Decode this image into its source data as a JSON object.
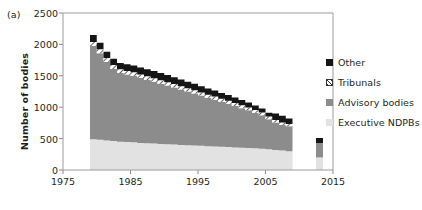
{
  "figure": {
    "panel_label": "(a)",
    "y_axis_title": "Number of bodies"
  },
  "chart_data": {
    "type": "area",
    "title": "",
    "subtitle": "",
    "xlabel": "",
    "ylabel": "Number of bodies",
    "xlim": [
      1975,
      2015
    ],
    "ylim": [
      0,
      2500
    ],
    "xticks": [
      1975,
      1985,
      1995,
      2005,
      2015
    ],
    "yticks": [
      0,
      500,
      1000,
      1500,
      2000,
      2500
    ],
    "grid": false,
    "legend_position": "right",
    "stacked": true,
    "stack_order_bottom_to_top": [
      "Executive NDPBs",
      "Advisory bodies",
      "Tribunals",
      "Other"
    ],
    "x": [
      1979,
      1980,
      1981,
      1982,
      1983,
      1984,
      1985,
      1986,
      1987,
      1988,
      1989,
      1990,
      1991,
      1992,
      1993,
      1994,
      1995,
      1996,
      1997,
      1998,
      1999,
      2000,
      2001,
      2002,
      2003,
      2004,
      2005,
      2006,
      2007,
      2008,
      2009,
      2013
    ],
    "series": [
      {
        "name": "Executive NDPBs",
        "color": "#e2e2e2",
        "pattern": "solid",
        "values": [
          490,
          480,
          470,
          460,
          450,
          445,
          440,
          430,
          425,
          420,
          415,
          410,
          405,
          400,
          395,
          390,
          385,
          380,
          375,
          370,
          365,
          360,
          355,
          350,
          345,
          340,
          330,
          320,
          310,
          300,
          295,
          200
        ]
      },
      {
        "name": "Advisory bodies",
        "color": "#8c8c8c",
        "pattern": "solid",
        "values": [
          1485,
          1380,
          1250,
          1150,
          1095,
          1075,
          1060,
          1035,
          1010,
          985,
          960,
          935,
          910,
          880,
          855,
          830,
          800,
          770,
          745,
          715,
          690,
          660,
          630,
          600,
          565,
          530,
          480,
          435,
          410,
          395,
          385,
          230
        ]
      },
      {
        "name": "Tribunals",
        "color": "#ffffff",
        "pattern": "hatched",
        "values": [
          65,
          63,
          62,
          60,
          60,
          58,
          58,
          57,
          56,
          55,
          55,
          54,
          53,
          52,
          52,
          51,
          50,
          50,
          49,
          48,
          48,
          47,
          46,
          45,
          45,
          44,
          42,
          40,
          38,
          36,
          35,
          0
        ]
      },
      {
        "name": "Other",
        "color": "#151515",
        "pattern": "solid",
        "values": [
          110,
          105,
          100,
          100,
          100,
          105,
          108,
          110,
          112,
          115,
          115,
          112,
          110,
          108,
          105,
          102,
          100,
          98,
          95,
          92,
          90,
          86,
          82,
          78,
          72,
          66,
          60,
          105,
          105,
          90,
          85,
          80
        ]
      }
    ],
    "legend": [
      {
        "label": "Other",
        "color": "#151515",
        "pattern": "solid"
      },
      {
        "label": "Tribunals",
        "color": "#ffffff",
        "pattern": "hatched"
      },
      {
        "label": "Advisory bodies",
        "color": "#8c8c8c",
        "pattern": "solid"
      },
      {
        "label": "Executive NDPBs",
        "color": "#e2e2e2",
        "pattern": "solid"
      }
    ]
  }
}
